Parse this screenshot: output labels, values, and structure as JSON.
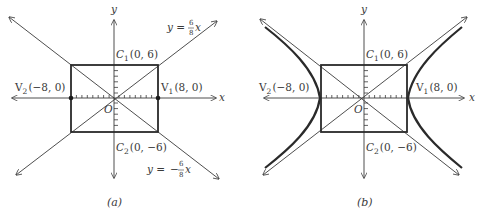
{
  "figure": {
    "panels": [
      {
        "id": "a",
        "caption": "(a)",
        "axis_labels": {
          "x": "x",
          "y": "y",
          "origin": "O"
        },
        "points": {
          "C1": {
            "label": "C",
            "sub": "1",
            "coords": "(0, 6)"
          },
          "C2": {
            "label": "C",
            "sub": "2",
            "coords": "(0, −6)"
          },
          "V1": {
            "label": "V",
            "sub": "1",
            "coords": "(8, 0)"
          },
          "V2": {
            "label": "V",
            "sub": "2",
            "coords": "(−8, 0)"
          }
        },
        "asymptotes": [
          {
            "lhs": "y =",
            "sign": "",
            "num": "6",
            "den": "8",
            "var": "x"
          },
          {
            "lhs": "y =",
            "sign": "−",
            "num": "6",
            "den": "8",
            "var": "x"
          }
        ],
        "shows_hyperbola": false
      },
      {
        "id": "b",
        "caption": "(b)",
        "axis_labels": {
          "x": "x",
          "y": "y",
          "origin": "O"
        },
        "points": {
          "C1": {
            "label": "C",
            "sub": "1",
            "coords": "(0, 6)"
          },
          "C2": {
            "label": "C",
            "sub": "2",
            "coords": "(0, −6)"
          },
          "V1": {
            "label": "V",
            "sub": "1",
            "coords": "(8, 0)"
          },
          "V2": {
            "label": "V",
            "sub": "2",
            "coords": "(−8, 0)"
          }
        },
        "shows_hyperbola": true
      }
    ],
    "colors": {
      "line": "#3a3a3a",
      "curve": "#2a2a2a",
      "text": "#3a3a3a"
    }
  }
}
